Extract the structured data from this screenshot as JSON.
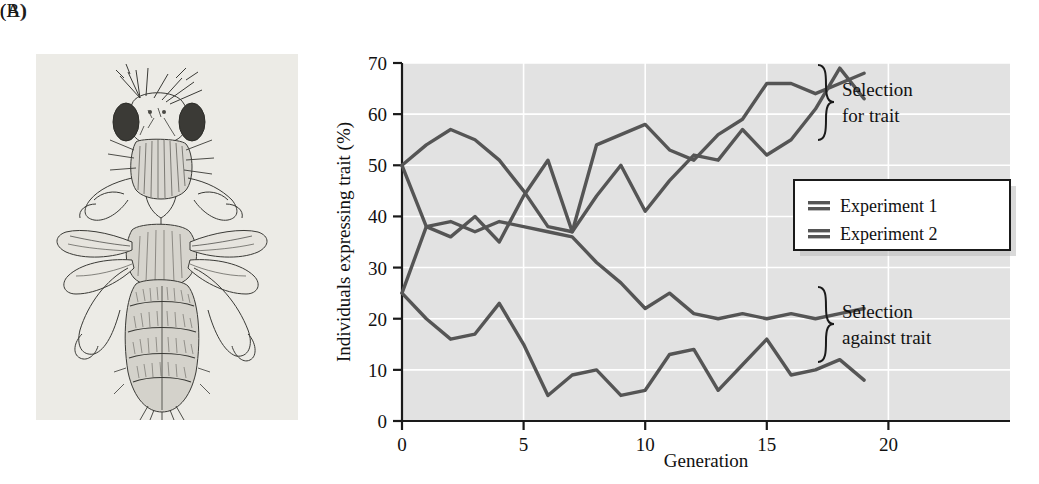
{
  "figure": {
    "panel_a_label": "(A)",
    "panel_b_label": "(B)",
    "panel_a_caption": "drosophila-bithorax-illustration"
  },
  "chart_data": {
    "type": "line",
    "title": "",
    "xlabel": "Generation",
    "ylabel": "Individuals expressing trait (%)",
    "xlim": [
      0,
      25
    ],
    "ylim": [
      0,
      70
    ],
    "xticks": [
      0,
      5,
      10,
      15,
      20
    ],
    "yticks": [
      0,
      10,
      20,
      30,
      40,
      50,
      60,
      70
    ],
    "grid": true,
    "grid_color": "#ffffff",
    "plot_background": "#e2e2e2",
    "line_color": "#555555",
    "legend": {
      "position": "right-middle",
      "entries": [
        "Experiment 1",
        "Experiment 2"
      ]
    },
    "annotations": [
      {
        "text": "Selection\nfor trait",
        "line1": "Selection",
        "line2": "for trait",
        "bracket": "upper"
      },
      {
        "text": "Selection\nagainst trait",
        "line1": "Selection",
        "line2": "against trait",
        "bracket": "lower"
      }
    ],
    "x": [
      0,
      1,
      2,
      3,
      4,
      5,
      6,
      7,
      8,
      9,
      10,
      11,
      12,
      13,
      14,
      15,
      16,
      17,
      18,
      19
    ],
    "series": [
      {
        "name": "Selection for trait - Experiment 1",
        "group": "selection-for-trait",
        "experiment": "Experiment 1",
        "values": [
          50,
          54,
          57,
          55,
          51,
          45,
          38,
          37,
          44,
          50,
          41,
          47,
          52,
          51,
          57,
          52,
          55,
          61,
          69,
          63
        ]
      },
      {
        "name": "Selection for trait - Experiment 2",
        "group": "selection-for-trait",
        "experiment": "Experiment 2",
        "values": [
          25,
          38,
          36,
          40,
          35,
          44,
          51,
          37,
          54,
          56,
          58,
          53,
          51,
          56,
          59,
          66,
          66,
          64,
          66,
          68
        ]
      },
      {
        "name": "Selection against trait - Experiment 1",
        "group": "selection-against-trait",
        "experiment": "Experiment 1",
        "values": [
          50,
          38,
          39,
          37,
          39,
          38,
          37,
          36,
          31,
          27,
          22,
          25,
          21,
          20,
          21,
          20,
          21,
          20,
          21,
          22
        ]
      },
      {
        "name": "Selection against trait - Experiment 2",
        "group": "selection-against-trait",
        "experiment": "Experiment 2",
        "values": [
          25,
          20,
          16,
          17,
          23,
          15,
          5,
          9,
          10,
          5,
          6,
          13,
          14,
          6,
          11,
          16,
          9,
          10,
          12,
          8
        ]
      }
    ]
  }
}
